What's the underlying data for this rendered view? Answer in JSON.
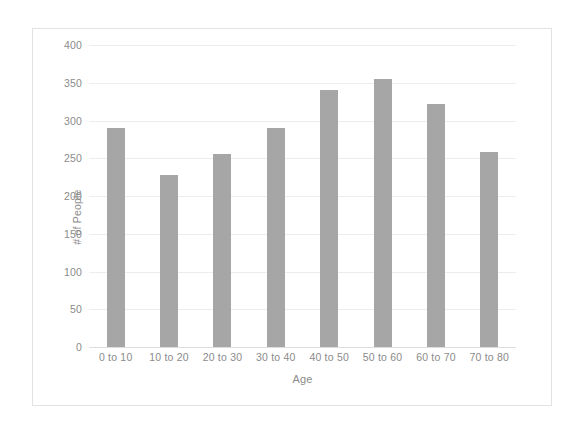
{
  "chart_data": {
    "type": "bar",
    "title": "",
    "xlabel": "Age",
    "ylabel": "# of People",
    "categories": [
      "0 to 10",
      "10 to 20",
      "20 to 30",
      "30 to 40",
      "40 to 50",
      "50 to 60",
      "60 to 70",
      "70 to 80"
    ],
    "values": [
      290,
      228,
      255,
      290,
      340,
      355,
      322,
      258
    ],
    "ylim": [
      0,
      400
    ],
    "yticks": [
      0,
      50,
      100,
      150,
      200,
      250,
      300,
      350,
      400
    ],
    "ytick_labels": [
      "0",
      "50",
      "100",
      "150",
      "200",
      "250",
      "300",
      "350",
      "400"
    ],
    "grid": "horizontal",
    "legend": "none",
    "bar_color": "#a6a6a6",
    "gridline_color": "#eceded",
    "text_color": "#8b8b8b",
    "frame_color": "#e2e2e2",
    "background": "#ffffff"
  }
}
